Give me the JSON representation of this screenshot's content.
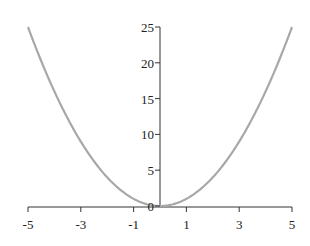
{
  "chart_data": {
    "type": "line",
    "title": "",
    "xlabel": "",
    "ylabel": "",
    "function": "y = x^2",
    "x": [
      -5,
      -4,
      -3,
      -2,
      -1,
      0,
      1,
      2,
      3,
      4,
      5
    ],
    "series": [
      {
        "name": "y = x^2",
        "values": [
          25,
          16,
          9,
          4,
          1,
          0,
          1,
          4,
          9,
          16,
          25
        ],
        "color": "#a8a8a8"
      }
    ],
    "xlim": [
      -5,
      5
    ],
    "ylim": [
      0,
      25
    ],
    "xticks": [
      "-5",
      "-3",
      "-1",
      "1",
      "3",
      "5"
    ],
    "yticks": [
      "0",
      "5",
      "10",
      "15",
      "20",
      "25"
    ],
    "grid": false,
    "legend": null
  }
}
